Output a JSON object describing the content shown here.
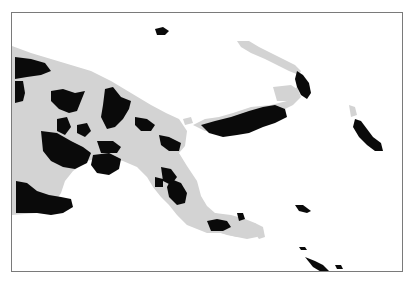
{
  "map": {
    "colors": {
      "background": "#ffffff",
      "land": "#d3d3d3",
      "highlight": "#0a0a0a",
      "frame": "#7a7a7a"
    },
    "land_shapes": [
      {
        "name": "new-guinea-mainland",
        "points": "11,45 30,52 50,58 70,64 90,70 110,80 130,92 150,104 165,112 178,118 186,130 184,145 178,152 186,165 196,180 200,195 206,205 214,212 226,216 238,222 244,232 236,236 220,232 206,232 196,228 186,224 176,214 168,204 160,196 152,186 146,176 136,166 122,160 104,156 86,160 72,170 64,180 60,192 52,204 36,212 11,214"
      },
      {
        "name": "southeast-islands",
        "points": "214,212 230,214 244,218 254,222 262,230 256,236 246,238 236,236 226,234 214,230"
      },
      {
        "name": "new-britain-west",
        "points": "192,124 204,118 218,116 232,112 250,106 270,104 286,100 290,92 296,86 300,96 292,104 280,110 270,118 256,124 244,128 232,132 218,132 204,130"
      },
      {
        "name": "new-britain-grey-patch",
        "points": "272,86 290,84 296,88 294,96 286,100 276,100"
      },
      {
        "name": "new-ireland-strip",
        "points": "236,40 248,40 258,46 270,52 282,58 294,64 300,70 298,74 288,70 276,64 264,58 250,52 240,46"
      },
      {
        "name": "small-islet-1",
        "points": "182,118 190,116 192,122 184,124"
      },
      {
        "name": "small-islet-2",
        "points": "254,222 262,226 264,236 258,238 252,230"
      },
      {
        "name": "bougainville-grey",
        "points": "348,104 354,106 356,114 350,116"
      }
    ],
    "highlight_shapes": [
      {
        "name": "northwest-block",
        "points": "14,56 30,58 44,62 50,70 40,74 26,76 14,78"
      },
      {
        "name": "west-strip",
        "points": "14,80 22,80 24,92 22,100 14,102"
      },
      {
        "name": "central-north",
        "points": "50,90 62,88 74,92 84,90 80,100 76,110 68,112 58,108 50,100"
      },
      {
        "name": "central-north-2",
        "points": "104,88 112,86 120,96 130,100 128,108 122,118 114,126 106,128 100,116 102,104"
      },
      {
        "name": "north-coast-east",
        "points": "134,116 146,118 154,124 150,130 140,130 134,124"
      },
      {
        "name": "central-mid-1",
        "points": "56,118 66,116 70,126 64,134 56,130"
      },
      {
        "name": "central-mid-2",
        "points": "76,124 86,122 90,130 84,136 76,132"
      },
      {
        "name": "central-big",
        "points": "40,130 56,132 70,140 82,146 90,152 86,162 74,168 62,166 50,160 42,150"
      },
      {
        "name": "central-east",
        "points": "96,140 112,140 120,146 116,152 100,152"
      },
      {
        "name": "central-east-2",
        "points": "92,154 108,152 120,158 118,168 108,174 96,172 90,164"
      },
      {
        "name": "east-highlands",
        "points": "158,134 168,136 180,142 178,150 168,150 160,144"
      },
      {
        "name": "east-coast-1",
        "points": "160,166 170,168 176,176 170,184 162,180"
      },
      {
        "name": "east-coast-2",
        "points": "170,178 180,182 186,192 184,202 176,204 168,196 166,186"
      },
      {
        "name": "east-coast-3",
        "points": "154,176 162,178 162,186 154,186"
      },
      {
        "name": "southwest-block",
        "points": "15,180 26,182 36,190 48,194 60,196 70,198 72,206 62,212 50,214 36,212 24,212 15,212"
      },
      {
        "name": "new-britain",
        "points": "200,124 214,120 230,116 248,110 262,106 274,104 284,108 286,116 274,122 262,126 248,132 236,134 222,136 208,132"
      },
      {
        "name": "new-ireland-tip",
        "points": "296,70 302,74 308,82 310,92 306,98 300,94 296,86 294,78"
      },
      {
        "name": "bougainville",
        "points": "354,118 360,120 366,128 372,136 380,142 382,150 374,150 366,144 358,136 352,126"
      },
      {
        "name": "north-islet",
        "points": "154,28 162,26 168,30 164,34 156,34"
      },
      {
        "name": "southeast-island-1",
        "points": "206,220 216,218 226,220 230,226 222,230 210,230"
      },
      {
        "name": "southeast-island-2",
        "points": "236,212 242,212 244,218 238,220"
      },
      {
        "name": "trobriand",
        "points": "294,204 302,204 310,210 306,212 298,210"
      },
      {
        "name": "louisiade-1",
        "points": "298,246 304,246 306,249 300,249"
      },
      {
        "name": "louisiade-2",
        "points": "304,256 314,260 322,264 328,270 322,272 312,266"
      },
      {
        "name": "louisiade-3",
        "points": "334,264 340,264 342,268 336,268"
      }
    ]
  }
}
